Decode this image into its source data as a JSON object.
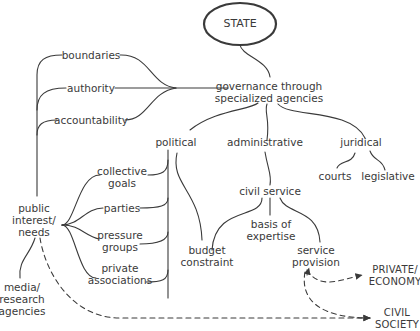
{
  "diagram": {
    "style": {
      "line_color": "#3a3a3a",
      "text_color": "#3a3a3a",
      "background": "#ffffff"
    },
    "nodes": {
      "state": "STATE",
      "governance": [
        "governance through",
        "specialized agencies"
      ],
      "boundaries": "boundaries",
      "authority": "authority",
      "accountability": "accountability",
      "political": "political",
      "administrative": "administrative",
      "juridical": "juridical",
      "courts": "courts",
      "legislative": "legislative",
      "civil_service": "civil service",
      "basis_of_expertise": [
        "basis of",
        "expertise"
      ],
      "budget_constraint": [
        "budget",
        "constraint"
      ],
      "service_provision": [
        "service",
        "provision"
      ],
      "collective_goals": [
        "collective",
        "goals"
      ],
      "parties": "parties",
      "pressure_groups": [
        "pressure",
        "groups"
      ],
      "private_associations": [
        "private",
        "associations"
      ],
      "public_interest": [
        "public",
        "interest/",
        "needs"
      ],
      "media_research": [
        "media/",
        "research",
        "agencies"
      ],
      "private_economy": [
        "PRIVATE/",
        "ECONOMY"
      ],
      "civil_society": [
        "CIVIL",
        "SOCIETY"
      ]
    },
    "edges": [
      {
        "from": "state",
        "to": "governance",
        "style": "solid"
      },
      {
        "from": "boundaries",
        "to": "governance",
        "style": "solid"
      },
      {
        "from": "authority",
        "to": "governance",
        "style": "solid"
      },
      {
        "from": "accountability",
        "to": "governance",
        "style": "solid"
      },
      {
        "from": "public_interest",
        "to": "boundaries",
        "style": "solid"
      },
      {
        "from": "public_interest",
        "to": "authority",
        "style": "solid"
      },
      {
        "from": "public_interest",
        "to": "accountability",
        "style": "solid"
      },
      {
        "from": "governance",
        "to": "political",
        "style": "solid"
      },
      {
        "from": "governance",
        "to": "administrative",
        "style": "solid"
      },
      {
        "from": "governance",
        "to": "juridical",
        "style": "solid"
      },
      {
        "from": "juridical",
        "to": "courts",
        "style": "solid"
      },
      {
        "from": "juridical",
        "to": "legislative",
        "style": "solid"
      },
      {
        "from": "administrative",
        "to": "civil_service",
        "style": "solid"
      },
      {
        "from": "civil_service",
        "to": "budget_constraint",
        "style": "solid"
      },
      {
        "from": "civil_service",
        "to": "basis_of_expertise",
        "style": "solid"
      },
      {
        "from": "civil_service",
        "to": "service_provision",
        "style": "solid"
      },
      {
        "from": "political",
        "to": "budget_constraint",
        "style": "solid"
      },
      {
        "from": "political",
        "to": "collective_goals",
        "style": "solid"
      },
      {
        "from": "political",
        "to": "parties",
        "style": "solid"
      },
      {
        "from": "political",
        "to": "pressure_groups",
        "style": "solid"
      },
      {
        "from": "political",
        "to": "private_associations",
        "style": "solid"
      },
      {
        "from": "public_interest",
        "to": "collective_goals",
        "style": "solid"
      },
      {
        "from": "public_interest",
        "to": "parties",
        "style": "solid"
      },
      {
        "from": "public_interest",
        "to": "pressure_groups",
        "style": "solid"
      },
      {
        "from": "public_interest",
        "to": "private_associations",
        "style": "solid"
      },
      {
        "from": "public_interest",
        "to": "media_research",
        "style": "solid"
      },
      {
        "from": "public_interest",
        "to": "civil_society",
        "style": "dashed-arrow"
      },
      {
        "from": "service_provision",
        "to": "private_economy",
        "style": "dashed-arrow"
      },
      {
        "from": "service_provision",
        "to": "civil_society",
        "style": "dashed-arrow"
      }
    ]
  }
}
